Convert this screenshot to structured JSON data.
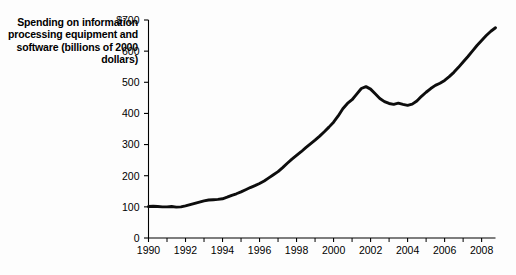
{
  "chart_data": {
    "type": "line",
    "title": "",
    "ylabel": "Spending on information processing equipment and software (billions of 2000 dollars)",
    "xlabel": "",
    "xlim": [
      1990,
      2008.75
    ],
    "ylim": [
      0,
      700
    ],
    "grid": false,
    "legend": null,
    "line_color": "#0d0d0d",
    "y_ticks": [
      {
        "value": 700,
        "label": "$700"
      },
      {
        "value": 600,
        "label": "600"
      },
      {
        "value": 500,
        "label": "500"
      },
      {
        "value": 400,
        "label": "400"
      },
      {
        "value": 300,
        "label": "300"
      },
      {
        "value": 200,
        "label": "200"
      },
      {
        "value": 100,
        "label": "100"
      },
      {
        "value": 0,
        "label": "0"
      }
    ],
    "x_ticks_labeled": [
      {
        "value": 1990,
        "label": "1990"
      },
      {
        "value": 1992,
        "label": "1992"
      },
      {
        "value": 1994,
        "label": "1994"
      },
      {
        "value": 1996,
        "label": "1996"
      },
      {
        "value": 1998,
        "label": "1998"
      },
      {
        "value": 2000,
        "label": "2000"
      },
      {
        "value": 2002,
        "label": "2002"
      },
      {
        "value": 2004,
        "label": "2004"
      },
      {
        "value": 2006,
        "label": "2006"
      },
      {
        "value": 2008,
        "label": "2008"
      }
    ],
    "x_ticks_minor": [
      1991,
      1993,
      1995,
      1997,
      1999,
      2001,
      2003,
      2005,
      2007
    ],
    "x": [
      1990.0,
      1990.25,
      1990.5,
      1990.75,
      1991.0,
      1991.25,
      1991.5,
      1991.75,
      1992.0,
      1992.25,
      1992.5,
      1992.75,
      1993.0,
      1993.25,
      1993.5,
      1993.75,
      1994.0,
      1994.25,
      1994.5,
      1994.75,
      1995.0,
      1995.25,
      1995.5,
      1995.75,
      1996.0,
      1996.25,
      1996.5,
      1996.75,
      1997.0,
      1997.25,
      1997.5,
      1997.75,
      1998.0,
      1998.25,
      1998.5,
      1998.75,
      1999.0,
      1999.25,
      1999.5,
      1999.75,
      2000.0,
      2000.25,
      2000.5,
      2000.75,
      2001.0,
      2001.25,
      2001.5,
      2001.75,
      2002.0,
      2002.25,
      2002.5,
      2002.75,
      2003.0,
      2003.25,
      2003.5,
      2003.75,
      2004.0,
      2004.25,
      2004.5,
      2004.75,
      2005.0,
      2005.25,
      2005.5,
      2005.75,
      2006.0,
      2006.25,
      2006.5,
      2006.75,
      2007.0,
      2007.25,
      2007.5,
      2007.75,
      2008.0,
      2008.25,
      2008.5,
      2008.75
    ],
    "values": [
      101,
      102,
      101,
      100,
      100,
      101,
      99,
      100,
      103,
      107,
      111,
      115,
      119,
      122,
      123,
      124,
      126,
      131,
      137,
      142,
      148,
      155,
      162,
      168,
      175,
      183,
      193,
      203,
      213,
      226,
      240,
      253,
      265,
      277,
      290,
      302,
      314,
      327,
      341,
      356,
      372,
      392,
      415,
      432,
      444,
      462,
      480,
      486,
      478,
      463,
      448,
      438,
      432,
      429,
      433,
      429,
      426,
      430,
      440,
      455,
      468,
      480,
      490,
      497,
      506,
      518,
      532,
      548,
      565,
      582,
      600,
      618,
      634,
      650,
      664,
      675
    ]
  }
}
